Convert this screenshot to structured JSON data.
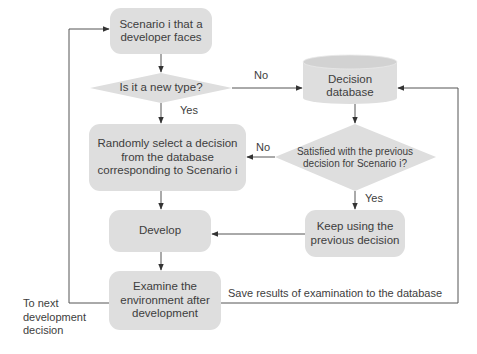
{
  "diagram": {
    "type": "flowchart",
    "nodes": {
      "scenario": "Scenario i that a developer faces",
      "new_type": "Is it a new type?",
      "database": "Decision database",
      "random_select": "Randomly select a decision from the database corresponding to Scenario i",
      "satisfied": "Satisfied with the previous decision for Scenario i?",
      "keep_using": "Keep using the previous decision",
      "develop": "Develop",
      "examine": "Examine the environment after development"
    },
    "node_lines": {
      "scenario": [
        "Scenario i that a",
        "developer faces"
      ],
      "database": [
        "Decision",
        "database"
      ],
      "random_select": [
        "Randomly select a decision",
        "from the database",
        "corresponding to Scenario i"
      ],
      "satisfied": [
        "Satisfied with the previous",
        "decision for Scenario i?"
      ],
      "keep_using": [
        "Keep using the",
        "previous decision"
      ],
      "examine": [
        "Examine the",
        "environment after",
        "development"
      ]
    },
    "edge_labels": {
      "new_type_no": "No",
      "new_type_yes": "Yes",
      "satisfied_no": "No",
      "satisfied_yes": "Yes",
      "save_results": "Save results of examination to the database",
      "next_decision": [
        "To next",
        "development",
        "decision"
      ]
    },
    "edges": [
      {
        "from": "scenario",
        "to": "new_type"
      },
      {
        "from": "new_type",
        "to": "database",
        "label": "No"
      },
      {
        "from": "new_type",
        "to": "random_select",
        "label": "Yes"
      },
      {
        "from": "database",
        "to": "satisfied"
      },
      {
        "from": "satisfied",
        "to": "random_select",
        "label": "No"
      },
      {
        "from": "satisfied",
        "to": "keep_using",
        "label": "Yes"
      },
      {
        "from": "random_select",
        "to": "develop"
      },
      {
        "from": "keep_using",
        "to": "develop"
      },
      {
        "from": "develop",
        "to": "examine"
      },
      {
        "from": "examine",
        "to": "database",
        "label": "Save results of examination to the database"
      },
      {
        "from": "examine",
        "to": "scenario",
        "label": "To next development decision"
      }
    ],
    "colors": {
      "node_fill": "#dedede",
      "line": "#555555",
      "text": "#3d3d3d"
    }
  }
}
